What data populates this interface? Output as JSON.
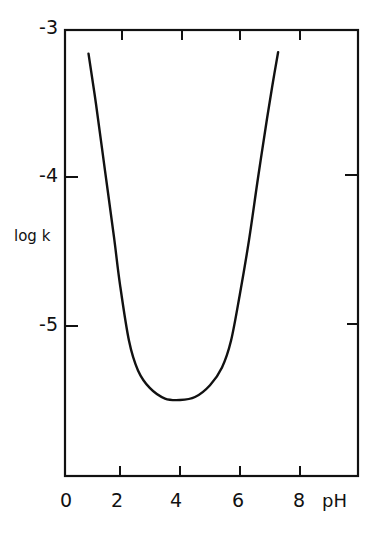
{
  "chart_data": {
    "type": "line",
    "title": "",
    "xlabel": "pH",
    "ylabel": "log k",
    "xlim": [
      0,
      9.7
    ],
    "ylim": [
      -6.0,
      -3.0
    ],
    "x_ticks": [
      "0",
      "2",
      "4",
      "6",
      "8"
    ],
    "y_ticks": [
      "-3",
      "-4",
      "-5"
    ],
    "grid": false,
    "legend": null,
    "series": [
      {
        "name": "log k vs pH",
        "x": [
          0.95,
          1.2,
          1.5,
          1.8,
          2.0,
          2.3,
          2.6,
          3.0,
          3.5,
          4.0,
          4.5,
          5.0,
          5.4,
          5.7,
          6.0,
          6.3,
          6.6,
          6.9,
          7.1,
          7.27
        ],
        "y": [
          -3.16,
          -3.5,
          -3.95,
          -4.4,
          -4.72,
          -5.1,
          -5.3,
          -5.42,
          -5.49,
          -5.5,
          -5.48,
          -5.4,
          -5.28,
          -5.1,
          -4.78,
          -4.42,
          -4.0,
          -3.6,
          -3.35,
          -3.15
        ]
      }
    ]
  },
  "labels": {
    "y_ticks": [
      "-3",
      "-4",
      "-5"
    ],
    "x_ticks": [
      "0",
      "2",
      "4",
      "6",
      "8"
    ],
    "y_title": "log k",
    "x_title": "pH"
  }
}
